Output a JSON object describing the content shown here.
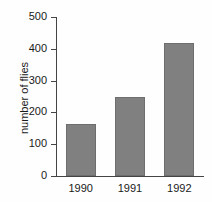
{
  "chart_data": {
    "type": "bar",
    "title": "",
    "subtitle": "",
    "xlabel": "",
    "ylabel": "number of flies",
    "categories": [
      "1990",
      "1991",
      "1992"
    ],
    "values": [
      165,
      248,
      418
    ],
    "series": [
      {
        "name": "number of flies",
        "values": [
          165,
          248,
          418
        ]
      }
    ],
    "ylim": [
      0,
      500
    ],
    "y_ticks": [
      0,
      100,
      200,
      300,
      400,
      500
    ],
    "y_tick_labels": [
      "0",
      "100",
      "200",
      "300",
      "400",
      "500"
    ],
    "x_tick_labels": [
      "1990",
      "1991",
      "1992"
    ],
    "grid": false,
    "legend": false,
    "legend_position": "none",
    "bar_color": "#808080",
    "bar_edge_color": "#6e6e6e",
    "axis_color": "#444444",
    "text_color": "#1a1a1a",
    "background_color": "#fefefe"
  }
}
